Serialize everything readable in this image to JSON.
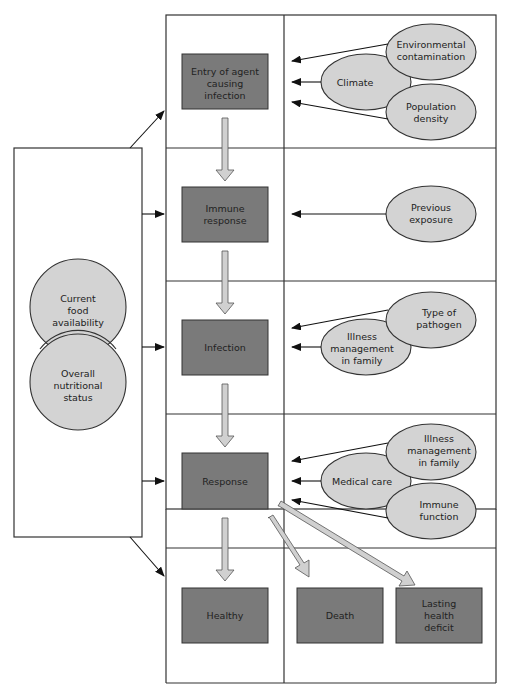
{
  "colors": {
    "box_fill": "#7a7a7a",
    "ellipse_fill": "#d3d3d3",
    "flow_arrow_fill": "#d0d0d0",
    "line": "#222222"
  },
  "left_panel": {
    "circles": [
      {
        "label": [
          "Current",
          "food",
          "availability"
        ]
      },
      {
        "label": [
          "Overall",
          "nutritional",
          "status"
        ]
      }
    ]
  },
  "stages": [
    {
      "box": [
        "Entry of agent",
        "causing",
        "infection"
      ],
      "factors": [
        [
          "Environmental",
          "contamination"
        ],
        [
          "Climate"
        ],
        [
          "Population",
          "density"
        ]
      ]
    },
    {
      "box": [
        "Immune",
        "response"
      ],
      "factors": [
        [
          "Previous",
          "exposure"
        ]
      ]
    },
    {
      "box": [
        "Infection"
      ],
      "factors": [
        [
          "Type of",
          "pathogen"
        ],
        [
          "Illness",
          "management",
          "in family"
        ]
      ]
    },
    {
      "box": [
        "Response"
      ],
      "factors": [
        [
          "Illness",
          "management",
          "in family"
        ],
        [
          "Medical care"
        ],
        [
          "Immune",
          "function"
        ]
      ]
    }
  ],
  "outcomes": [
    {
      "label": [
        "Healthy"
      ]
    },
    {
      "label": [
        "Death"
      ]
    },
    {
      "label": [
        "Lasting",
        "health",
        "deficit"
      ]
    }
  ]
}
